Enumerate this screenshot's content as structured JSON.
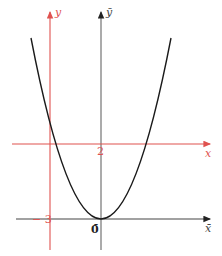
{
  "diagram": {
    "type": "coordinate-translation",
    "curve": "parabola",
    "colors": {
      "original_axes": "#e0524f",
      "translated_axes": "#333333",
      "curve": "#1a1a1a"
    },
    "labels": {
      "y_axis": "y",
      "y_bar_axis": "ȳ",
      "x_axis": "x",
      "x_bar_axis": "x̄",
      "x_tick": "2",
      "y_tick": "− 3",
      "origin_bar": "0̄"
    }
  }
}
